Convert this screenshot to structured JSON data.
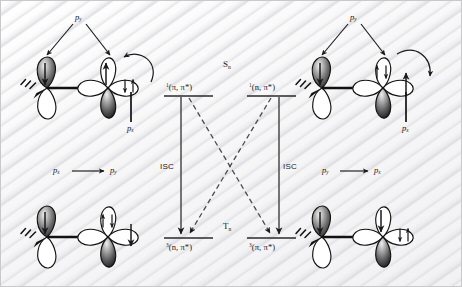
{
  "figure": {
    "type": "orbital-and-jablonski-diagram",
    "background_color": "#fbfbfb",
    "ink_color": "#1a1a1a"
  },
  "energy_diagram": {
    "manifolds": [
      {
        "key": "singlet",
        "label": "S",
        "subscript": "n"
      },
      {
        "key": "triplet",
        "label": "T",
        "subscript": "n"
      }
    ],
    "levels": [
      {
        "id": "s-pipi",
        "multiplicity": "1",
        "configuration": "(π, π*)",
        "manifold": "singlet",
        "side": "left"
      },
      {
        "id": "s-npi",
        "multiplicity": "1",
        "configuration": "(n, π*)",
        "manifold": "singlet",
        "side": "right"
      },
      {
        "id": "t-npi",
        "multiplicity": "3",
        "configuration": "(n, π*)",
        "manifold": "triplet",
        "side": "left"
      },
      {
        "id": "t-pipi",
        "multiplicity": "3",
        "configuration": "(π, π*)",
        "manifold": "triplet",
        "side": "right"
      }
    ],
    "transitions": [
      {
        "id": "isc-left",
        "label": "ISC",
        "style": "solid",
        "from": "s-pipi",
        "to": "t-npi"
      },
      {
        "id": "isc-right",
        "label": "ISC",
        "style": "solid",
        "from": "s-npi",
        "to": "t-pipi"
      },
      {
        "id": "cross-left",
        "label": "",
        "style": "dashed",
        "from": "s-pipi",
        "to": "t-pipi"
      },
      {
        "id": "cross-right",
        "label": "",
        "style": "dashed",
        "from": "s-npi",
        "to": "t-npi"
      }
    ]
  },
  "orbital_panels": [
    {
      "id": "top-left",
      "position": "top-left",
      "py_label": "p",
      "py_subscript": "y",
      "px_label": "p",
      "px_subscript": "x",
      "left_lobe_spin": "down",
      "vertical_lobe_spins": [
        "up"
      ],
      "side_lobe_spins": [
        "down",
        "up"
      ],
      "curved_arrow": "to-left"
    },
    {
      "id": "top-right",
      "position": "top-right",
      "py_label": "p",
      "py_subscript": "y",
      "px_label": "p",
      "px_subscript": "x",
      "left_lobe_spin": "down",
      "vertical_lobe_spins": [
        "up",
        "down"
      ],
      "side_lobe_spins": [
        "up"
      ],
      "curved_arrow": "to-right"
    },
    {
      "id": "bottom-left",
      "position": "bottom-left",
      "left_lobe_spin": "down",
      "vertical_lobe_spins": [
        "up",
        "down"
      ],
      "side_lobe_spins": [
        "down"
      ],
      "curved_arrow": "none"
    },
    {
      "id": "bottom-right",
      "position": "bottom-right",
      "left_lobe_spin": "down",
      "vertical_lobe_spins": [
        "down"
      ],
      "side_lobe_spins": [
        "down",
        "up"
      ],
      "curved_arrow": "none"
    }
  ],
  "orbital_transitions": [
    {
      "id": "left-transition",
      "from_label": "p",
      "from_subscript": "x",
      "to_label": "p",
      "to_subscript": "y"
    },
    {
      "id": "right-transition",
      "from_label": "p",
      "from_subscript": "y",
      "to_label": "p",
      "to_subscript": "x"
    }
  ]
}
